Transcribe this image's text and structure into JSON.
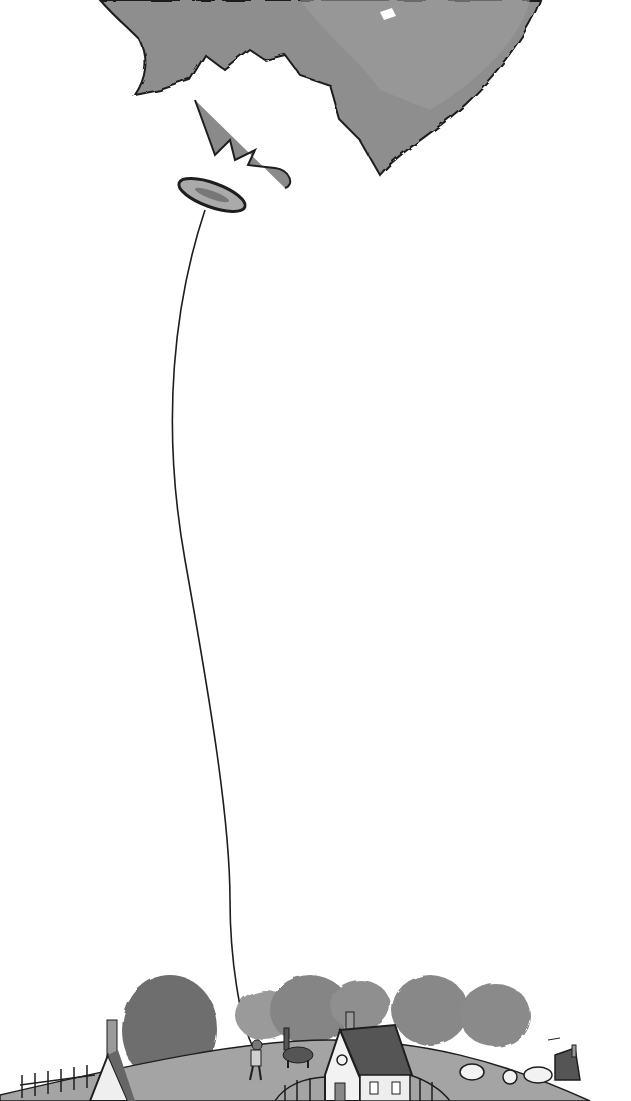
{
  "image": {
    "description": "Grayscale ink-and-watercolor illustration of a giant balloon floating high in the sky, tied by a long thin string held by a small child standing on a hill in a village with trees, cottages, a dog, fences and sheep.",
    "style": "ink and watercolor wash, grayscale",
    "colors": {
      "background": "#ffffff",
      "balloon": "#8c8c8c",
      "balloon_dark": "#5a5a5a",
      "ink": "#1e1e1e",
      "trees": "#7a7a7a",
      "hill": "#9a9a9a",
      "roof": "#555555",
      "house_wall": "#f2f2f2"
    },
    "elements": [
      "balloon",
      "balloon-knot",
      "balloon-string",
      "child-holding-string",
      "dog",
      "cottage-center",
      "cottage-left",
      "cottage-right",
      "trees",
      "fences",
      "sheep"
    ]
  }
}
